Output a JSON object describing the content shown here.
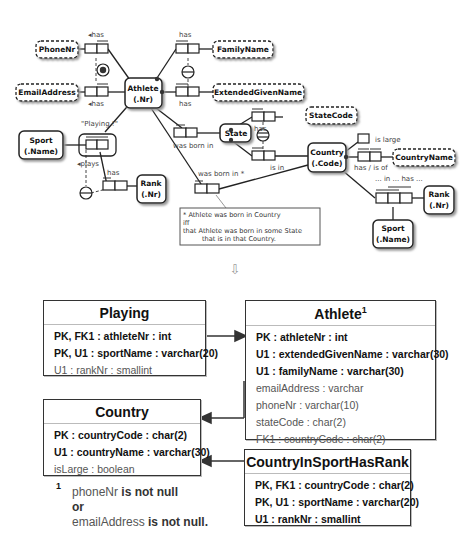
{
  "orm_diagram": {
    "entities": [
      {
        "name": "Athlete",
        "ref": "(.Nr)"
      },
      {
        "name": "State",
        "ref": ""
      },
      {
        "name": "Country",
        "ref": "(.Code)"
      },
      {
        "name": "Sport",
        "ref": "(.Name)",
        "instance": "left"
      },
      {
        "name": "Rank",
        "ref": "(.Nr)",
        "instance": "left"
      },
      {
        "name": "Rank",
        "ref": "(.Nr)",
        "instance": "right"
      },
      {
        "name": "Sport",
        "ref": "(.Name)",
        "instance": "bottom-right"
      }
    ],
    "value_types": [
      "PhoneNr",
      "FamilyName",
      "EmailAddress",
      "ExtendedGivenName",
      "StateCode",
      "CountryName"
    ],
    "objectified_fact": "\"Playing !\"",
    "fact_readings": {
      "phone_has": "◂has",
      "email_has": "◂has",
      "family_has": "has",
      "given_has": "has",
      "state_was_born_in": "was born in",
      "country_was_born_in": "was born in *",
      "state_has": "has",
      "state_is_in": "is in",
      "is_large": "is large",
      "country_has": "has / is of",
      "ternary": "... in ... has ...",
      "plays": "◂plays",
      "playing_has": "has"
    },
    "note": {
      "line1": "* Athlete was born in Country",
      "line2": "iff",
      "line3": "that Athlete was born in some State",
      "line4": "that is in that Country."
    },
    "transform_arrow": "⇩"
  },
  "tables": {
    "playing": {
      "title": "Playing",
      "rows": [
        {
          "text": "PK, FK1 : athleteNr : int",
          "bold": true
        },
        {
          "text": "PK, U1 : sportName : varchar(20)",
          "bold": true
        },
        {
          "text": "U1 : rankNr : smallint",
          "bold": false
        }
      ]
    },
    "athlete": {
      "title": "Athlete",
      "title_sup": "1",
      "rows": [
        {
          "text": "PK : athleteNr : int",
          "bold": true
        },
        {
          "text": "U1 : extendedGivenName : varchar(30)",
          "bold": true
        },
        {
          "text": "U1 : familyName : varchar(30)",
          "bold": true
        },
        {
          "text": "emailAddress : varchar",
          "bold": false
        },
        {
          "text": "phoneNr : varchar(10)",
          "bold": false
        },
        {
          "text": "stateCode : char(2)",
          "bold": false
        },
        {
          "text": "FK1 : countryCode : char(2)",
          "bold": false
        }
      ]
    },
    "country": {
      "title": "Country",
      "rows": [
        {
          "text": "PK : countryCode : char(2)",
          "bold": true
        },
        {
          "text": "U1 : countryName : varchar(30)",
          "bold": true
        },
        {
          "text": "isLarge : boolean",
          "bold": false
        }
      ]
    },
    "country_in_sport_has_rank": {
      "title": "CountryInSportHasRank",
      "rows": [
        {
          "text": "PK, FK1 : countryCode : char(2)",
          "bold": true
        },
        {
          "text": "PK, U1 : sportName : varchar(20)",
          "bold": true
        },
        {
          "text": "U1 : rankNr : smallint",
          "bold": true
        }
      ]
    }
  },
  "footnote": {
    "marker": "1",
    "part1": "phoneNr",
    "part2": " is not null",
    "part3": "or",
    "part4": "emailAddress",
    "part5": " is not null."
  }
}
